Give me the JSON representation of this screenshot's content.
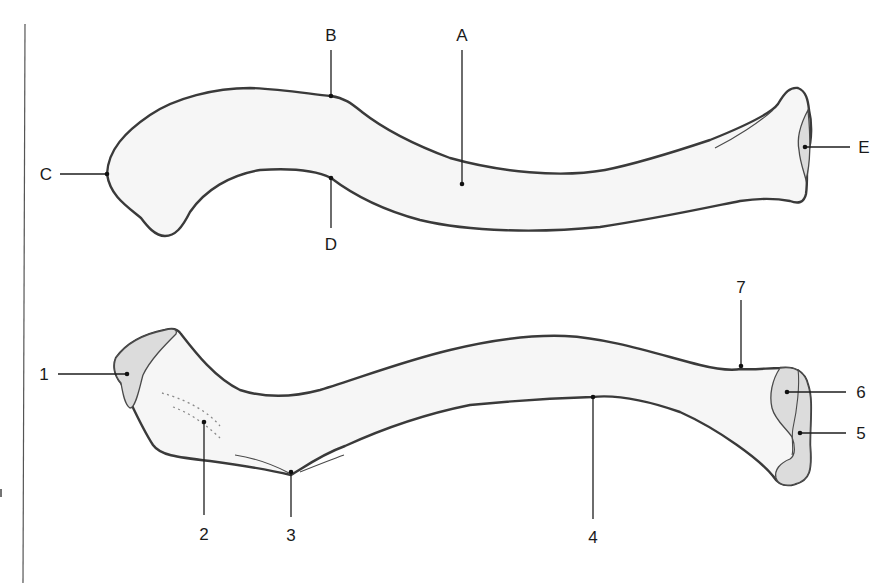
{
  "diagram": {
    "colors": {
      "bone_fill": "#f6f6f6",
      "bone_outline": "#3a3a3a",
      "facet_fill": "#dcdcdc",
      "label_color": "#1a1a1a"
    },
    "top_view": {
      "labels": {
        "A": "A",
        "B": "B",
        "C": "C",
        "D": "D",
        "E": "E"
      }
    },
    "bottom_view": {
      "labels": {
        "n1": "1",
        "n2": "2",
        "n3": "3",
        "n4": "4",
        "n5": "5",
        "n6": "6",
        "n7": "7"
      }
    }
  }
}
